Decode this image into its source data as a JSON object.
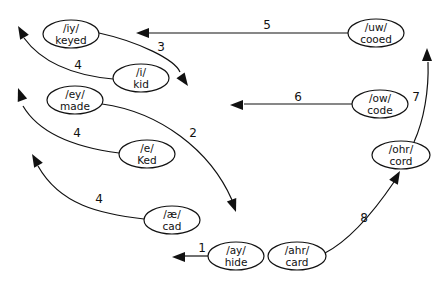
{
  "diagram": {
    "type": "vowel-shift-chain",
    "nodes": [
      {
        "id": "iy",
        "phoneme": "/iy/",
        "word": "keyed",
        "cx": 71,
        "cy": 34,
        "rx": 28,
        "ry": 14
      },
      {
        "id": "i",
        "phoneme": "/i/",
        "word": "kid",
        "cx": 141,
        "cy": 78,
        "rx": 28,
        "ry": 14
      },
      {
        "id": "ey",
        "phoneme": "/ey/",
        "word": "made",
        "cx": 75,
        "cy": 100,
        "rx": 28,
        "ry": 14
      },
      {
        "id": "e",
        "phoneme": "/e/",
        "word": "Ked",
        "cx": 147,
        "cy": 154,
        "rx": 28,
        "ry": 14
      },
      {
        "id": "ae",
        "phoneme": "/æ/",
        "word": "cad",
        "cx": 172,
        "cy": 220,
        "rx": 28,
        "ry": 14
      },
      {
        "id": "ay",
        "phoneme": "/ay/",
        "word": "hide",
        "cx": 236,
        "cy": 256,
        "rx": 28,
        "ry": 14
      },
      {
        "id": "ahr",
        "phoneme": "/ahr/",
        "word": "card",
        "cx": 297,
        "cy": 256,
        "rx": 29,
        "ry": 14
      },
      {
        "id": "ohr",
        "phoneme": "/ohr/",
        "word": "cord",
        "cx": 401,
        "cy": 155,
        "rx": 29,
        "ry": 14
      },
      {
        "id": "ow",
        "phoneme": "/ow/",
        "word": "code",
        "cx": 380,
        "cy": 104,
        "rx": 28,
        "ry": 14
      },
      {
        "id": "uw",
        "phoneme": "/uw/",
        "word": "cooed",
        "cx": 376,
        "cy": 33,
        "rx": 28,
        "ry": 14
      }
    ],
    "edges": [
      {
        "label": "1",
        "from": "ay",
        "path": "M208 256 L182 256",
        "arrow": {
          "x": 172,
          "y": 257,
          "angle": 180
        },
        "label_pos": {
          "x": 202,
          "y": 252
        }
      },
      {
        "label": "2",
        "from": "ey",
        "path": "M102 104 C160 112, 210 150, 232 200",
        "arrow": {
          "x": 236,
          "y": 212,
          "angle": 70
        },
        "label_pos": {
          "x": 193,
          "y": 137
        }
      },
      {
        "label": "3",
        "from": "iy",
        "path": "M99 33 C140 42, 175 60, 180 72",
        "arrow": {
          "x": 188,
          "y": 86,
          "angle": 55
        },
        "label_pos": {
          "x": 161,
          "y": 51
        }
      },
      {
        "label": "4",
        "from": "i",
        "path": "M113 79 C70 75, 40 60, 24 38",
        "arrow": {
          "x": 18,
          "y": 26,
          "angle": 240
        },
        "label_pos": {
          "x": 78,
          "y": 69
        }
      },
      {
        "label": "4",
        "from": "e",
        "path": "M119 153 C80 148, 40 135, 23 106",
        "arrow": {
          "x": 18,
          "y": 88,
          "angle": 250
        },
        "label_pos": {
          "x": 77,
          "y": 137
        }
      },
      {
        "label": "4",
        "from": "ae",
        "path": "M144 219 C100 214, 60 205, 38 166",
        "arrow": {
          "x": 32,
          "y": 154,
          "angle": 240
        },
        "label_pos": {
          "x": 99,
          "y": 203
        }
      },
      {
        "label": "5",
        "from": "uw",
        "path": "M348 33 L148 33",
        "arrow": {
          "x": 136,
          "y": 33,
          "angle": 180
        },
        "label_pos": {
          "x": 267,
          "y": 29
        }
      },
      {
        "label": "6",
        "from": "ow",
        "path": "M352 104 L244 104",
        "arrow": {
          "x": 230,
          "y": 105,
          "angle": 180
        },
        "label_pos": {
          "x": 298,
          "y": 101
        }
      },
      {
        "label": "7",
        "from": "ohr",
        "path": "M414 142 C424 120, 429 90, 428 62",
        "arrow": {
          "x": 427,
          "y": 48,
          "angle": 270
        },
        "label_pos": {
          "x": 416,
          "y": 101
        }
      },
      {
        "label": "8",
        "from": "ahr",
        "path": "M325 253 C350 240, 375 210, 394 182",
        "arrow": {
          "x": 400,
          "y": 171,
          "angle": 300
        },
        "label_pos": {
          "x": 364,
          "y": 222
        }
      }
    ]
  },
  "colors": {
    "background": "#ffffff",
    "stroke": "#111111",
    "text": "#111111"
  }
}
